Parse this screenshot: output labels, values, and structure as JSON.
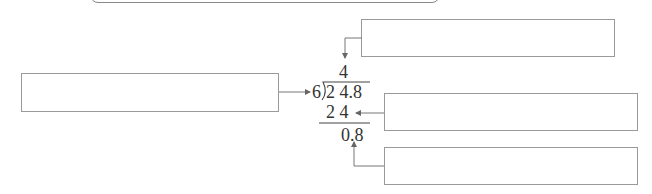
{
  "division": {
    "divisor": "6",
    "dividend": "2 4.8",
    "quotient": "4",
    "product": "2 4",
    "remainder": "0.8"
  },
  "annotation_boxes": {
    "top_right": "",
    "left": "",
    "middle_right": "",
    "bottom_right": ""
  }
}
